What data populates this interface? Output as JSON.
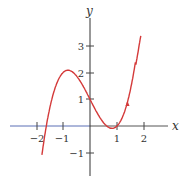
{
  "chart_data": {
    "type": "line",
    "title": "",
    "xlabel": "x",
    "ylabel": "y",
    "xlim": [
      -2.9,
      2.8
    ],
    "ylim": [
      -1.8,
      3.9
    ],
    "grid": false,
    "legend": null,
    "x_ticks": [
      -2,
      -1,
      1,
      2
    ],
    "x_tick_labels": [
      "−2",
      "−1",
      "1",
      "2"
    ],
    "y_ticks": [
      -1,
      1,
      2,
      3
    ],
    "y_tick_labels": [
      "−1",
      "1",
      "2",
      "3"
    ],
    "series": [
      {
        "name": "y = x³ − 2x + 1",
        "color": "#d43a3a",
        "x": [
          -1.78,
          -1.618,
          -1.4,
          -1.2,
          -1.0,
          -0.816,
          -0.6,
          -0.4,
          -0.2,
          0.0,
          0.2,
          0.4,
          0.6,
          0.816,
          1.0,
          1.2,
          1.4,
          1.6,
          1.8,
          1.9
        ],
        "y": [
          -1.5,
          0.0,
          1.06,
          1.67,
          2.0,
          2.09,
          1.98,
          1.74,
          1.39,
          1.0,
          0.61,
          0.26,
          -0.0,
          -0.0,
          0.0,
          0.33,
          0.94,
          1.9,
          3.2,
          3.5
        ]
      }
    ],
    "annotations": [
      {
        "type": "arrowhead",
        "x": 1.35,
        "y": 0.85,
        "direction": "up-right"
      }
    ],
    "axis_colors": {
      "x_negative": "#5b6fb5",
      "x_positive": "#444444",
      "y": "#333333"
    }
  }
}
